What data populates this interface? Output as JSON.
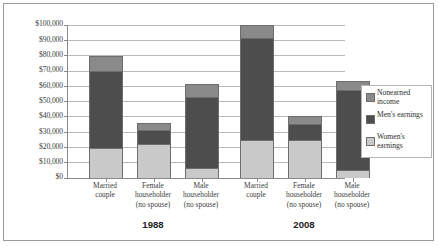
{
  "chart_data": {
    "type": "bar",
    "subtype": "stacked-bar-grouped",
    "title": "",
    "xlabel": "",
    "ylabel": "",
    "ylim": [
      0,
      100000
    ],
    "ytick_step": 10000,
    "grid": true,
    "legend_position": "right",
    "ytick_labels": [
      "$100,000",
      "$90,000",
      "$80,000",
      "$70,000",
      "$60,000",
      "$50,000",
      "$40,000",
      "$30,000",
      "$20,000",
      "$10,000",
      "$0"
    ],
    "ytick_values": [
      100000,
      90000,
      80000,
      70000,
      60000,
      50000,
      40000,
      30000,
      20000,
      10000,
      0
    ],
    "groups": [
      {
        "label": "1988",
        "categories": [
          {
            "lines": [
              "Married",
              "couple"
            ],
            "women_earnings": 19500,
            "mens_earnings": 50200,
            "nonearned_income": 9800,
            "total": 79500
          },
          {
            "lines": [
              "Female",
              "householder",
              "(no spouse)"
            ],
            "women_earnings": 22000,
            "mens_earnings": 9000,
            "nonearned_income": 4500,
            "total": 35500
          },
          {
            "lines": [
              "Male",
              "householder",
              "(no spouse)"
            ],
            "women_earnings": 6500,
            "mens_earnings": 46500,
            "nonearned_income": 8000,
            "total": 61000
          }
        ]
      },
      {
        "label": "2008",
        "categories": [
          {
            "lines": [
              "Married",
              "couple"
            ],
            "women_earnings": 24600,
            "mens_earnings": 67000,
            "nonearned_income": 8200,
            "total": 99800
          },
          {
            "lines": [
              "Female",
              "householder",
              "(no spouse)"
            ],
            "women_earnings": 24600,
            "mens_earnings": 10500,
            "nonearned_income": 5400,
            "total": 40500
          },
          {
            "lines": [
              "Male",
              "householder",
              "(no spouse)"
            ],
            "women_earnings": 5100,
            "mens_earnings": 52300,
            "nonearned_income": 5600,
            "total": 63000
          }
        ]
      }
    ],
    "series": [
      {
        "name": "Nonearned income",
        "key": "nonearned_income",
        "color": "#8a8a8a"
      },
      {
        "name": "Men's earnings",
        "key": "mens_earnings",
        "color": "#4d4d4d"
      },
      {
        "name": "Women's earnings",
        "key": "women_earnings",
        "color": "#c9c9c9"
      }
    ],
    "legend": [
      {
        "label": "Nonearned income",
        "color": "#8a8a8a"
      },
      {
        "label": "Men's earnings",
        "color": "#4d4d4d"
      },
      {
        "label": "Women's earnings",
        "color": "#c9c9c9"
      }
    ],
    "colors": {
      "nonearned_income": "#8a8a8a",
      "mens_earnings": "#4d4d4d",
      "women_earnings": "#c9c9c9",
      "gridline": "#b9b9b9",
      "axis": "#8a8a8a",
      "border": "#9a9a9a",
      "bar_outline": "#6d6d6d"
    }
  }
}
